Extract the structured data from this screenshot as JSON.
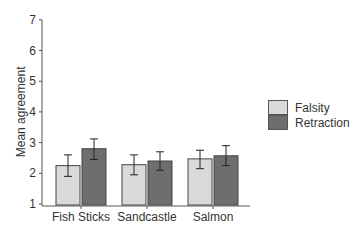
{
  "chart_data": {
    "type": "bar",
    "title": "",
    "xlabel": "",
    "ylabel": "Mean agreement",
    "ylim": [
      1,
      7
    ],
    "yticks": [
      1,
      2,
      3,
      4,
      5,
      6,
      7
    ],
    "grid": false,
    "legend_position": "right",
    "categories": [
      "Fish Sticks",
      "Sandcastle",
      "Salmon"
    ],
    "series": [
      {
        "name": "Falsity",
        "color": "#d9d9d9",
        "values": [
          2.25,
          2.28,
          2.47
        ],
        "error_low": [
          1.9,
          1.95,
          2.15
        ],
        "error_high": [
          2.6,
          2.6,
          2.75
        ]
      },
      {
        "name": "Retraction",
        "color": "#6e6e6e",
        "values": [
          2.8,
          2.4,
          2.57
        ],
        "error_low": [
          2.45,
          2.1,
          2.25
        ],
        "error_high": [
          3.12,
          2.7,
          2.9
        ]
      }
    ]
  },
  "legend": {
    "items": [
      {
        "label": "Falsity",
        "color": "#d9d9d9"
      },
      {
        "label": "Retraction",
        "color": "#6e6e6e"
      }
    ]
  }
}
